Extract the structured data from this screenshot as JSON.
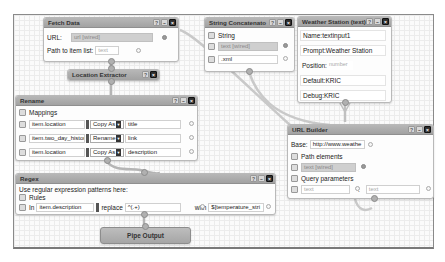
{
  "modules": {
    "fetch_data": {
      "title": "Fetch Data",
      "url_label": "URL:",
      "url_value": "url [wired]",
      "path_label": "Path to item list:",
      "path_placeholder": "text"
    },
    "location_extractor": {
      "title": "Location Extractor"
    },
    "rename": {
      "title": "Rename",
      "mappings_label": "Mappings",
      "rows": [
        {
          "field": "item.location",
          "op": "Copy As",
          "target": "title"
        },
        {
          "field": "item.two_day_history",
          "op": "Rename",
          "target": "link"
        },
        {
          "field": "item.location",
          "op": "Copy As",
          "target": "description"
        }
      ]
    },
    "string_concatenate": {
      "title": "String Concatenato",
      "string_label": "String",
      "items": [
        "text [wired]",
        ".xml"
      ]
    },
    "weather_station": {
      "title": "Weather Station (text)",
      "name_label": "Name:",
      "name_value": "textinput1",
      "prompt_label": "Prompt:",
      "prompt_value": "Weather Station",
      "position_label": "Position:",
      "position_placeholder": "number",
      "default_label": "Default:",
      "default_value": "KRIC",
      "debug_label": "Debug:",
      "debug_value": "KRIC"
    },
    "url_builder": {
      "title": "URL Builder",
      "base_label": "Base:",
      "base_value": "http://www.weathe",
      "path_elements_label": "Path elements",
      "path_element_value": "text [wired]",
      "query_params_label": "Query parameters",
      "query_key_placeholder": "text",
      "query_sep": ":",
      "query_value_placeholder": "text"
    },
    "regex": {
      "title": "Regex",
      "description": "Use regular expression patterns here:",
      "rules_label": "Rules",
      "in_label": "In",
      "in_value": "item.description",
      "replace_label": "replace",
      "replace_value": "^(.+)",
      "with_label": "with",
      "with_value": "$[temperature_stri"
    },
    "pipe_output": {
      "title": "Pipe Output"
    }
  },
  "header_buttons": {
    "help": "?",
    "minimize": "–",
    "close": "×"
  }
}
